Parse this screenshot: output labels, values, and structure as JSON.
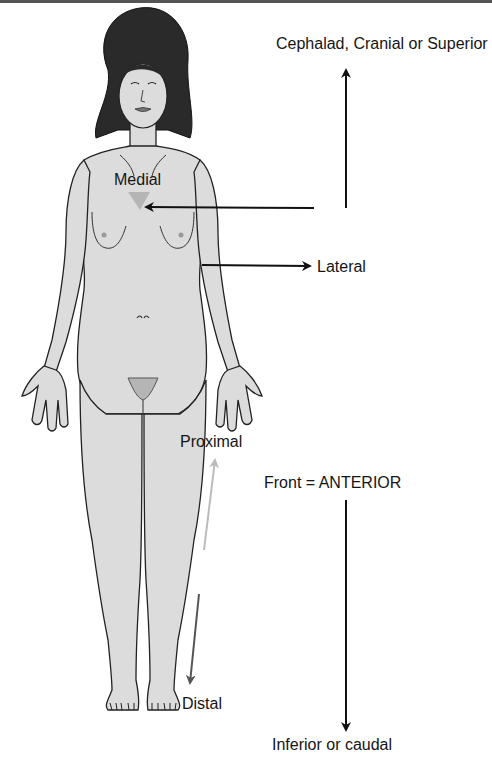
{
  "diagram": {
    "labels": {
      "superior": "Cephalad, Cranial or Superior",
      "medial": "Medial",
      "lateral": "Lateral",
      "proximal": "Proximal",
      "anterior": "Front = ANTERIOR",
      "distal": "Distal",
      "inferior": "Inferior or caudal"
    },
    "arrows": [
      {
        "name": "superior-arrow",
        "direction": "up",
        "color": "#111111"
      },
      {
        "name": "medial-arrow",
        "direction": "left",
        "color": "#111111"
      },
      {
        "name": "lateral-arrow",
        "direction": "right",
        "color": "#111111"
      },
      {
        "name": "proximal-arrow",
        "direction": "up",
        "color": "#bbbbbb"
      },
      {
        "name": "distal-arrow",
        "direction": "down",
        "color": "#555555"
      },
      {
        "name": "inferior-arrow",
        "direction": "down",
        "color": "#111111"
      }
    ],
    "colors": {
      "skin": "#dcdcdc",
      "hair": "#2a2a2a",
      "outline": "#222222",
      "shade": "#b5b5b5"
    }
  }
}
